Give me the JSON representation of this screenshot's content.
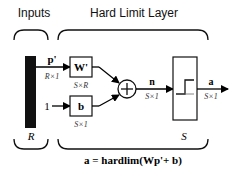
{
  "diagram": {
    "sections": {
      "inputs_label": "Inputs",
      "layer_label": "Hard Limit Layer"
    },
    "input": {
      "vector_label": "p'",
      "vector_dim": "R×1",
      "size_label": "R"
    },
    "weight": {
      "label": "W'",
      "dim": "S×R"
    },
    "bias": {
      "input_label": "1",
      "label": "b",
      "dim": "S×1"
    },
    "summer": {
      "symbol": "+"
    },
    "net_input": {
      "label": "n",
      "dim": "S×1"
    },
    "transfer": {
      "name": "hardlim",
      "size_label": "S"
    },
    "output": {
      "label": "a",
      "dim": "S×1"
    },
    "equation": "a = hardlim(Wp'+ b)"
  }
}
